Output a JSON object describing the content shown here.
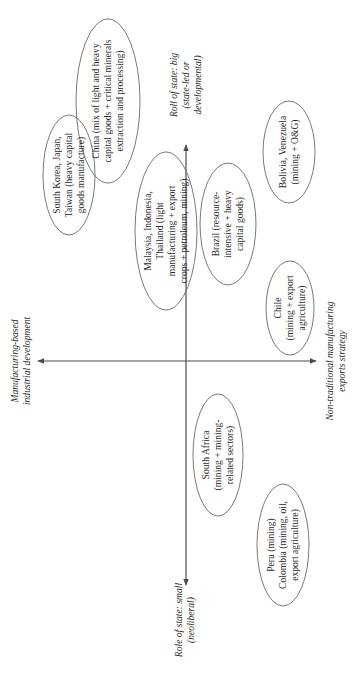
{
  "diagram": {
    "orientation": "rotated-90-ccw",
    "axes": {
      "top": {
        "lines": [
          "Roll of state: big",
          "(state-led or",
          "developmental)"
        ]
      },
      "bottom": {
        "lines": [
          "Role of state: small",
          "(neoliberal)"
        ]
      },
      "left": {
        "lines": [
          "Manufacturing-based",
          "industrial development"
        ]
      },
      "right": {
        "lines": [
          "Non-traditional manufacturing",
          "exports strategy"
        ]
      }
    },
    "nodes": [
      {
        "id": "china",
        "lines": [
          "China (mix of light and heavy",
          "capital goods + critical minerals",
          "extraction and processing)"
        ]
      },
      {
        "id": "south-korea",
        "lines": [
          "South Korea, Japan,",
          "Taiwan (heavy capital",
          "goods manufacture)"
        ]
      },
      {
        "id": "malaysia",
        "lines": [
          "Malaysia, Indonesia,",
          "Thailand (light",
          "manufacturing + export",
          "crops + petroleum, mining)"
        ]
      },
      {
        "id": "brazil",
        "lines": [
          "Brazil (resource-",
          "intensive + heavy",
          "capital goods)"
        ]
      },
      {
        "id": "bolivia",
        "lines": [
          "Bolivia, Venezuela",
          "(mining + O&G)"
        ]
      },
      {
        "id": "chile",
        "lines": [
          "Chile",
          "(mining + export",
          "agriculture)"
        ]
      },
      {
        "id": "south-africa",
        "lines": [
          "South Africa",
          "(mining + mining-",
          "related sectors)"
        ]
      },
      {
        "id": "peru-colombia",
        "lines": [
          "Peru (mining)",
          "Colombia (mining, oil,",
          "export agriculture)"
        ]
      }
    ]
  }
}
